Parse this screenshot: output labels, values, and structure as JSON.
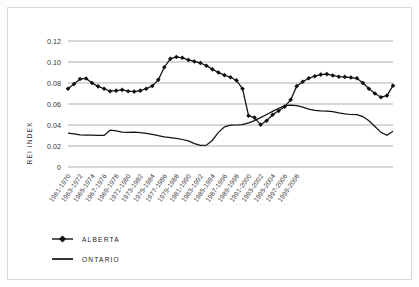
{
  "chart_data": {
    "type": "line",
    "title": "",
    "xlabel": "",
    "ylabel": "REI INDEX",
    "ylim": [
      0,
      0.12
    ],
    "yticks": [
      "0",
      "0.02",
      "0.04",
      "0.06",
      "0.08",
      "0.10",
      "0.12"
    ],
    "ytick_values": [
      0,
      0.02,
      0.04,
      0.06,
      0.08,
      0.1,
      0.12
    ],
    "grid": true,
    "legend_position": "bottom-left",
    "categories": [
      "1961-1970",
      "1962-1971",
      "1963-1972",
      "1964-1973",
      "1965-1974",
      "1966-1975",
      "1967-1976",
      "1968-1977",
      "1969-1978",
      "1970-1979",
      "1971-1980",
      "1972-1981",
      "1973-1982",
      "1974-1983",
      "1975-1984",
      "1976-1985",
      "1977-1986",
      "1978-1987",
      "1979-1988",
      "1980-1989",
      "1981-1990",
      "1982-1991",
      "1983-1992",
      "1984-1993",
      "1985-1994",
      "1986-1995",
      "1987-1996",
      "1988-1997",
      "1989-1998",
      "1990-1999",
      "1991-2000",
      "1992-2001",
      "1993-2002",
      "1994-2003",
      "1995-2004",
      "1996-2005",
      "1997-2006",
      "1998-2007",
      "1999-2008"
    ],
    "xtick_labels": [
      "1961-1970",
      "1963-1972",
      "1965-1974",
      "1967-1976",
      "1969-1978",
      "1971-1980",
      "1973-1982",
      "1975-1984",
      "1977-1986",
      "1979-1988",
      "1981-1990",
      "1983-1992",
      "1985-1994",
      "1987-1996",
      "1989-1998",
      "1991-2000",
      "1993-2002",
      "1995-2004",
      "1997-2006",
      "1999-2008"
    ],
    "series": [
      {
        "name": "ALBERTA",
        "marker": "diamond",
        "values": [
          0.0745,
          0.079,
          0.0838,
          0.0843,
          0.08,
          0.0768,
          0.0745,
          0.0722,
          0.0727,
          0.0735,
          0.0722,
          0.0718,
          0.0727,
          0.0745,
          0.0772,
          0.083,
          0.095,
          0.103,
          0.1048,
          0.104,
          0.102,
          0.1005,
          0.099,
          0.0965,
          0.093,
          0.09,
          0.0875,
          0.0855,
          0.0825,
          0.0745,
          0.0488,
          0.047,
          0.0402,
          0.044,
          0.0498,
          0.0535,
          0.0575,
          0.064,
          0.077
        ]
      },
      {
        "name": "ONTARIO",
        "marker": "none",
        "values": [
          0.0322,
          0.0315,
          0.0305,
          0.0303,
          0.0303,
          0.0302,
          0.0301,
          0.035,
          0.0345,
          0.0333,
          0.033,
          0.0333,
          0.0328,
          0.032,
          0.031,
          0.0298,
          0.0288,
          0.028,
          0.0272,
          0.0262,
          0.0248,
          0.0222,
          0.0205,
          0.0208,
          0.0255,
          0.033,
          0.0382,
          0.0398,
          0.04,
          0.0403,
          0.042,
          0.0442,
          0.047,
          0.05,
          0.053,
          0.056,
          0.0585,
          0.059,
          0.0585
        ]
      }
    ],
    "series_extended": {
      "note": "full resolution sample of both curves across 59 plotted positions",
      "alberta_tail": [
        0.0812,
        0.0845,
        0.0865,
        0.088,
        0.0885,
        0.0872,
        0.086,
        0.0858,
        0.0852,
        0.0845,
        0.08,
        0.0745,
        0.07,
        0.0665,
        0.068,
        0.0775
      ],
      "ontario_tail": [
        0.057,
        0.0552,
        0.054,
        0.0535,
        0.0532,
        0.0528,
        0.0515,
        0.0505,
        0.05,
        0.0498,
        0.048,
        0.044,
        0.0385,
        0.033,
        0.0302,
        0.034
      ]
    }
  },
  "legend": {
    "items": [
      {
        "label": "ALBERTA",
        "marker": "diamond"
      },
      {
        "label": "ONTARIO",
        "marker": "none"
      }
    ]
  },
  "axis": {
    "y_title": "REI INDEX"
  }
}
